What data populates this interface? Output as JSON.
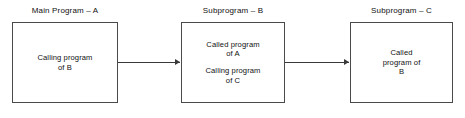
{
  "diagram": {
    "title_text": "Program call structure diagram",
    "background_color": "#ffffff",
    "border_color": "#4a4a4a",
    "text_color": "#111111",
    "nodes": [
      {
        "id": "main-program-a",
        "label": "Main Program – A",
        "lines": [
          "Calling program\nof B"
        ]
      },
      {
        "id": "subprogram-b",
        "label": "Subprogram – B",
        "lines": [
          "Called program\nof A",
          "Calling program\nof C"
        ]
      },
      {
        "id": "subprogram-c",
        "label": "Subprogram – C",
        "lines": [
          "Called\nprogram of\nB"
        ]
      }
    ],
    "edges": [
      {
        "id": "edge-a-to-b",
        "from": "main-program-a",
        "to": "subprogram-b",
        "arrowhead": "right-arrow-icon"
      },
      {
        "id": "edge-b-to-c",
        "from": "subprogram-b",
        "to": "subprogram-c",
        "arrowhead": "right-arrow-icon"
      }
    ]
  }
}
